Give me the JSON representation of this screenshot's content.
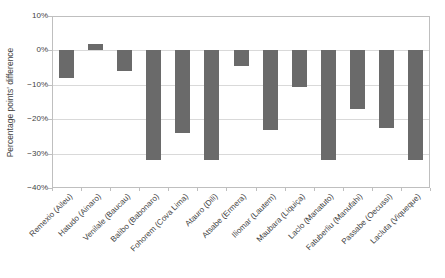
{
  "chart_data": {
    "type": "bar",
    "title": "",
    "xlabel": "",
    "ylabel": "Percentage points' difference",
    "ylim": [
      -40,
      10
    ],
    "grid": true,
    "legend": "none",
    "yticks": [
      {
        "value": 10,
        "label": "10%"
      },
      {
        "value": 0,
        "label": "0%"
      },
      {
        "value": -10,
        "label": "−10%"
      },
      {
        "value": -20,
        "label": "−20%"
      },
      {
        "value": -30,
        "label": "−30%"
      },
      {
        "value": -40,
        "label": "−40%"
      }
    ],
    "categories": [
      "Remexio (Aileu)",
      "Hatudo (Ainaro)",
      "Venilale (Baucau)",
      "Balibo (Babonaro)",
      "Fohorem (Cova Lima)",
      "Atauro (Dili)",
      "Atsabe (Ermera)",
      "Iliomar (Lautem)",
      "Maubara (Liquiça)",
      "Laclo (Manatuto)",
      "Fatuberliu (Manufahi)",
      "Passabe (Oecussi)",
      "Lacluta (Viqueque)"
    ],
    "values": [
      -8,
      2,
      -6,
      -32,
      -24,
      -32,
      -4.5,
      -23,
      -10.5,
      -32,
      -17,
      -22.5,
      -32
    ]
  },
  "colors": {
    "bar": "#6a6a6a",
    "gridline": "#d9d9d9",
    "axis_box": "#bfbfbf",
    "tick": "#bfbfbf",
    "text": "#3f3f3f",
    "background": "#ffffff"
  }
}
